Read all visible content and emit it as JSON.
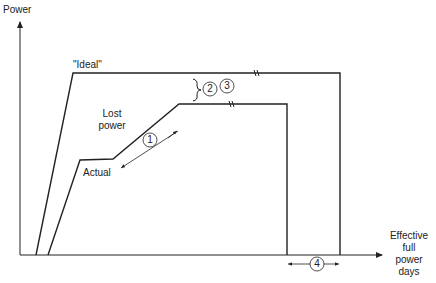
{
  "labels": {
    "y_axis": "Power",
    "x_axis_line1": "Effective",
    "x_axis_line2": "full",
    "x_axis_line3": "power",
    "x_axis_line4": "days",
    "ideal": "\"Ideal\"",
    "lost_line1": "Lost",
    "lost_line2": "power",
    "actual": "Actual"
  },
  "markers": [
    "1",
    "2",
    "3",
    "4"
  ],
  "colors": {
    "line": "#222222",
    "background": "#ffffff"
  }
}
